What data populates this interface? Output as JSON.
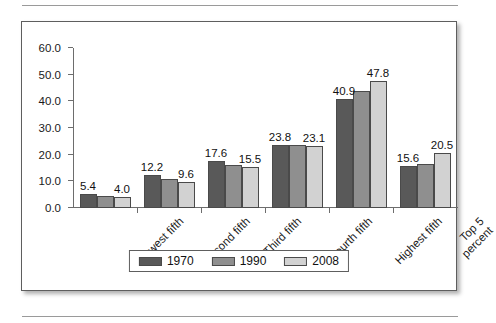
{
  "chart_data": {
    "type": "bar",
    "title": "",
    "subtitle": "",
    "xlabel": "",
    "ylabel": "",
    "ylim": [
      0.0,
      60.0
    ],
    "ytick_step": 10.0,
    "ytick_labels": [
      "0.0",
      "10.0",
      "20.0",
      "30.0",
      "40.0",
      "50.0",
      "60.0"
    ],
    "grid": false,
    "legend_position": "bottom-center",
    "categories": [
      "Lowest fifth",
      "Second fifth",
      "Third fifth",
      "Fourth fifth",
      "Highest fifth",
      "Top 5\npercent"
    ],
    "series": [
      {
        "name": "1970",
        "color": "#595959",
        "values": [
          5.4,
          12.2,
          17.6,
          23.8,
          40.9,
          15.6
        ]
      },
      {
        "name": "1990",
        "color": "#8f8f8f",
        "values": [
          4.6,
          10.8,
          16.2,
          23.5,
          43.9,
          16.6
        ]
      },
      {
        "name": "2008",
        "color": "#d2d2d2",
        "values": [
          4.0,
          9.6,
          15.5,
          23.1,
          47.8,
          20.5
        ]
      }
    ],
    "data_labels": [
      {
        "category": "Lowest fifth",
        "series": "1970",
        "text": "5.4"
      },
      {
        "category": "Lowest fifth",
        "series": "2008",
        "text": "4.0"
      },
      {
        "category": "Second fifth",
        "series": "1970",
        "text": "12.2"
      },
      {
        "category": "Second fifth",
        "series": "2008",
        "text": "9.6"
      },
      {
        "category": "Third fifth",
        "series": "1970",
        "text": "17.6"
      },
      {
        "category": "Third fifth",
        "series": "2008",
        "text": "15.5"
      },
      {
        "category": "Fourth fifth",
        "series": "1970",
        "text": "23.8"
      },
      {
        "category": "Fourth fifth",
        "series": "2008",
        "text": "23.1"
      },
      {
        "category": "Highest fifth",
        "series": "1970",
        "text": "40.9"
      },
      {
        "category": "Highest fifth",
        "series": "2008",
        "text": "47.8"
      },
      {
        "category": "Top 5 percent",
        "series": "1970",
        "text": "15.6"
      },
      {
        "category": "Top 5 percent",
        "series": "2008",
        "text": "20.5"
      }
    ]
  },
  "legend": {
    "items": [
      {
        "label": "1970",
        "color": "#595959"
      },
      {
        "label": "1990",
        "color": "#8f8f8f"
      },
      {
        "label": "2008",
        "color": "#d2d2d2"
      }
    ]
  }
}
